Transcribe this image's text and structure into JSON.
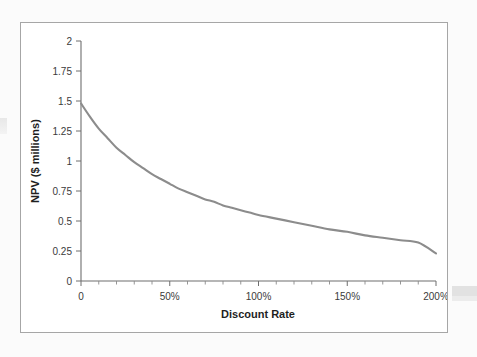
{
  "figure": {
    "background_color": "#fbfbfb",
    "card_background": "#ffffff",
    "card_border_color": "#a6a6a6"
  },
  "chart_data": {
    "type": "line",
    "title": "",
    "subtitle": "",
    "xlabel": "Discount Rate",
    "ylabel": "NPV ($ millions)",
    "xlim": [
      0,
      200
    ],
    "ylim": [
      0,
      2
    ],
    "grid": false,
    "legend": null,
    "legend_position": "none",
    "line_color": "#8c8c8c",
    "x_tick_labels": [
      "0",
      "50%",
      "100%",
      "150%",
      "200%"
    ],
    "x_tick_values": [
      0,
      50,
      100,
      150,
      200
    ],
    "x_minor_tick_count_per_interval": 4,
    "y_tick_labels": [
      "0",
      "0.25",
      "0.5",
      "0.75",
      "1",
      "1.25",
      "1.5",
      "1.75",
      "2"
    ],
    "y_tick_values": [
      0,
      0.25,
      0.5,
      0.75,
      1,
      1.25,
      1.5,
      1.75,
      2
    ],
    "series": [
      {
        "name": "NPV",
        "x": [
          0,
          5,
          10,
          15,
          20,
          25,
          30,
          35,
          40,
          45,
          50,
          55,
          60,
          65,
          70,
          75,
          80,
          85,
          90,
          95,
          100,
          110,
          120,
          130,
          140,
          150,
          160,
          170,
          180,
          190,
          200
        ],
        "values": [
          1.48,
          1.37,
          1.27,
          1.19,
          1.11,
          1.05,
          0.99,
          0.94,
          0.89,
          0.85,
          0.81,
          0.77,
          0.74,
          0.71,
          0.68,
          0.66,
          0.63,
          0.61,
          0.59,
          0.57,
          0.55,
          0.52,
          0.49,
          0.46,
          0.43,
          0.41,
          0.38,
          0.36,
          0.34,
          0.32,
          0.23
        ]
      }
    ],
    "annotations": []
  }
}
